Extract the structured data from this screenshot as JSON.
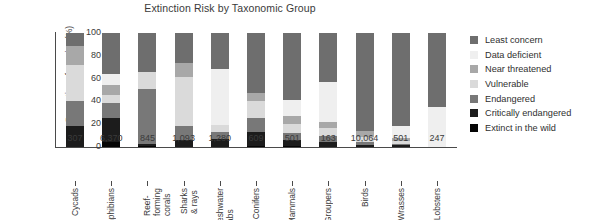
{
  "chart_data": {
    "type": "bar",
    "title": "Extinction Risk by Taxonomic Group",
    "xlabel": "",
    "ylabel": "Proportion of species (%)",
    "ylim": [
      0,
      100
    ],
    "yticks": [
      0,
      20,
      40,
      60,
      80,
      100
    ],
    "grid": false,
    "stacked": true,
    "legend_position": "right",
    "categories": [
      "Cycads",
      "Amphibians",
      "Reef-forming\ncorals",
      "Sharks & rays",
      "Freshwater\ncrabs",
      "Conifers",
      "Mammals",
      "Groupers",
      "Birds",
      "Wrasses",
      "Lobsters"
    ],
    "category_counts": [
      "307",
      "6,370",
      "845",
      "1,093",
      "1,280",
      "609",
      "501",
      "163",
      "10,064",
      "501",
      "247"
    ],
    "series": [
      {
        "name": "Least concern",
        "color": "#6e6e6e",
        "values": [
          11,
          36,
          34,
          26,
          32,
          53,
          59,
          43,
          86,
          82,
          65
        ]
      },
      {
        "name": "Data deficient",
        "color": "#efefef",
        "values": [
          0,
          10,
          0,
          0,
          49,
          0,
          14,
          35,
          0,
          10,
          35
        ]
      },
      {
        "name": "Near threatened",
        "color": "#a8a8a8",
        "values": [
          17,
          8,
          0,
          13,
          0,
          7,
          7,
          5,
          5,
          3,
          0
        ]
      },
      {
        "name": "Vulnerable",
        "color": "#dadada",
        "values": [
          32,
          7,
          15,
          43,
          6,
          15,
          8,
          7,
          5,
          2,
          0
        ]
      },
      {
        "name": "Endangered",
        "color": "#787878",
        "values": [
          22,
          14,
          48,
          12,
          6,
          12,
          6,
          6,
          2,
          1,
          0
        ]
      },
      {
        "name": "Critically endangered",
        "color": "#1c1c1c",
        "values": [
          18,
          21,
          2,
          6,
          7,
          12,
          5,
          4,
          2,
          2,
          0
        ]
      },
      {
        "name": "Extinct in the wild",
        "color": "#050505",
        "values": [
          0,
          4,
          1,
          0,
          0,
          1,
          1,
          0,
          0,
          0,
          0
        ]
      }
    ]
  },
  "legend": {
    "items": [
      {
        "label": "Least concern",
        "color": "#6e6e6e"
      },
      {
        "label": "Data deficient",
        "color": "#efefef"
      },
      {
        "label": "Near threatened",
        "color": "#a8a8a8"
      },
      {
        "label": "Vulnerable",
        "color": "#dadada"
      },
      {
        "label": "Endangered",
        "color": "#787878"
      },
      {
        "label": "Critically endangered",
        "color": "#1c1c1c"
      },
      {
        "label": "Extinct in the wild",
        "color": "#050505"
      }
    ]
  }
}
